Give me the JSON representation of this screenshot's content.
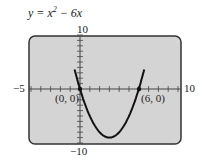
{
  "chart_data": {
    "type": "line",
    "function": "x^2 - 6x",
    "xlim": [
      -5,
      10
    ],
    "ylim": [
      -10,
      10
    ],
    "x_tick_labels": {
      "min": "−5",
      "max": "10"
    },
    "y_tick_labels": {
      "max": "10",
      "min": "−10"
    },
    "tick_step": 1,
    "points": [
      {
        "x": 0,
        "y": 0,
        "label": "(0, 0)"
      },
      {
        "x": 6,
        "y": 0,
        "label": "(6, 0)"
      }
    ],
    "vertex": {
      "x": 3,
      "y": -9
    },
    "grid": false,
    "colors": {
      "screen": "#d4d4d4",
      "curve": "#111111"
    }
  }
}
